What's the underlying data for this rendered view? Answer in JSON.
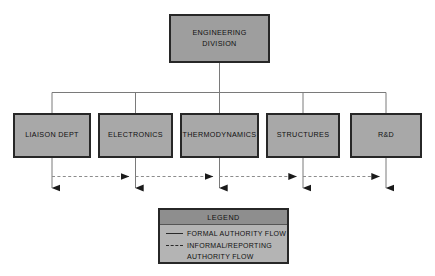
{
  "diagram": {
    "title_node": {
      "label": "ENGINEERING\nDIVISION"
    },
    "departments": [
      {
        "label": "LIAISON DEPT"
      },
      {
        "label": "ELECTRONICS"
      },
      {
        "label": "THERMODYNAMICS"
      },
      {
        "label": "STRUCTURES"
      },
      {
        "label": "R&D"
      }
    ],
    "legend": {
      "title": "LEGEND",
      "items": [
        {
          "style": "solid",
          "label": "FORMAL AUTHORITY FLOW",
          "label2": ""
        },
        {
          "style": "dashed",
          "label": "INFORMAL/REPORTING",
          "label2": "AUTHORITY FLOW"
        }
      ]
    },
    "colors": {
      "box_fill": "#a8a8a8",
      "root_fill": "#9e9e9e",
      "legend_fill": "#b4b4b4",
      "legend_title_fill": "#8e8e8e",
      "border": "#272727",
      "line": "#7a7a7a",
      "arrow": "#1a1a1a",
      "background": "#ffffff"
    }
  }
}
